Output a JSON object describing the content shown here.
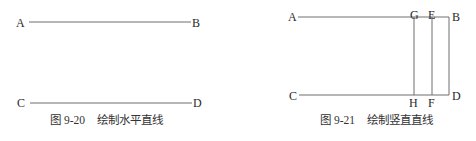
{
  "figures": [
    {
      "id": "9-20",
      "caption_number": "图 9-20",
      "caption_title": "绘制水平直线",
      "labels": {
        "A": "A",
        "B": "B",
        "C": "C",
        "D": "D"
      }
    },
    {
      "id": "9-21",
      "caption_number": "图 9-21",
      "caption_title": "绘制竖直直线",
      "labels": {
        "A": "A",
        "B": "B",
        "C": "C",
        "D": "D",
        "E": "E",
        "F": "F",
        "G": "G",
        "H": "H"
      }
    }
  ],
  "colors": {
    "line": "#6e6e6e",
    "text": "#2a2a2a"
  }
}
